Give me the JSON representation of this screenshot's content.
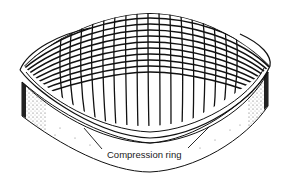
{
  "figure": {
    "colors": {
      "ink": "#111111",
      "background": "#ffffff",
      "stipple": "#444444"
    }
  },
  "labels": {
    "compression_ring": "Compression ring"
  }
}
